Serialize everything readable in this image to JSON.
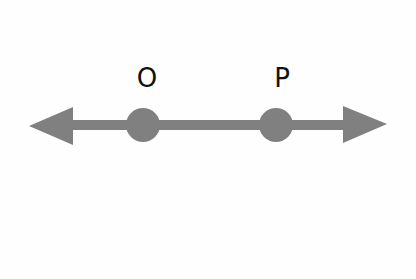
{
  "diagram": {
    "type": "number-line",
    "colors": {
      "line": "#808080",
      "point": "#808080",
      "label": "#111111",
      "background": "#fefefe"
    },
    "line": {
      "y": 125,
      "x_start": 29,
      "x_end": 387,
      "thickness": 10,
      "arrows": [
        "left",
        "right"
      ]
    },
    "points": [
      {
        "label": "O",
        "cx": 143,
        "cy": 125,
        "r": 17,
        "label_x": 147,
        "label_y": 87
      },
      {
        "label": "P",
        "cx": 276,
        "cy": 125,
        "r": 17,
        "label_x": 282,
        "label_y": 87
      }
    ]
  }
}
